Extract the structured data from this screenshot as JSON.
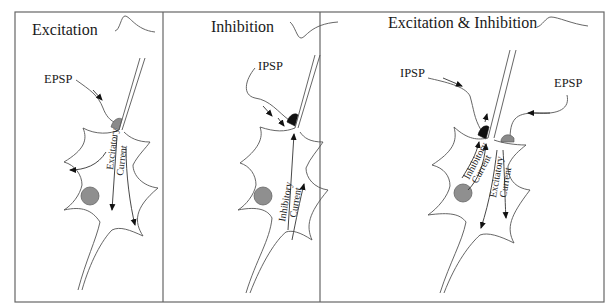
{
  "panels": [
    {
      "id": "excitation",
      "title": "Excitation",
      "waveform": "positive-deflection",
      "inputs": [
        {
          "label": "EPSP",
          "synapse": "excitatory"
        }
      ],
      "currents": [
        {
          "line1": "Excitatory",
          "line2": "Current",
          "direction": "down"
        }
      ]
    },
    {
      "id": "inhibition",
      "title": "Inhibition",
      "waveform": "negative-deflection",
      "inputs": [
        {
          "label": "IPSP",
          "synapse": "inhibitory"
        }
      ],
      "currents": [
        {
          "line1": "Inhibitory",
          "line2": "Current",
          "direction": "up"
        }
      ]
    },
    {
      "id": "excitation-inhibition",
      "title": "Excitation & Inhibition",
      "waveform": "small-deflection",
      "inputs": [
        {
          "label": "IPSP",
          "synapse": "inhibitory"
        },
        {
          "label": "EPSP",
          "synapse": "excitatory"
        }
      ],
      "currents": [
        {
          "line1": "Inhibitory",
          "line2": "Current",
          "direction": "up"
        },
        {
          "line1": "Excitatory",
          "line2": "Current",
          "direction": "down"
        }
      ]
    }
  ],
  "colors": {
    "frame": "#666666",
    "nucleus": "#8f8f8f",
    "excitatory_synapse": "#8a8a8a",
    "inhibitory_synapse": "#111111"
  }
}
